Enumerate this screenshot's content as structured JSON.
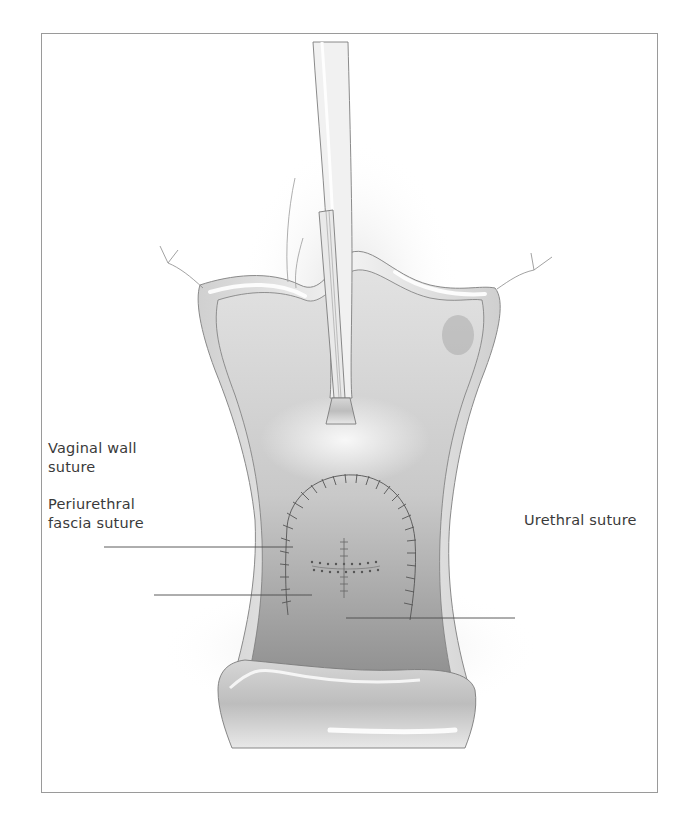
{
  "figure": {
    "labels": {
      "vaginal_wall_suture_line1": "Vaginal wall",
      "vaginal_wall_suture_line2": "suture",
      "periurethral_line1": "Periurethral",
      "periurethral_line2": "fascia suture",
      "urethral_suture": "Urethral suture"
    },
    "colors": {
      "frame": "#9a9a9a",
      "leader_line": "#4a4a4a",
      "tissue_light": "#e6e6e6",
      "tissue_mid": "#c8c8c8",
      "tissue_dark": "#9c9c9c",
      "suture": "#555555",
      "text": "#3a3a3a"
    }
  }
}
